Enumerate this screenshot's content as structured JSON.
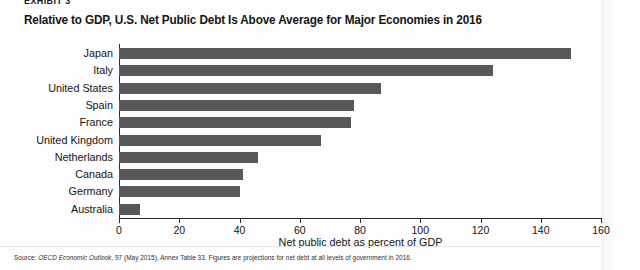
{
  "exhibit_tag": "EXHIBIT 3",
  "chart_title": "Relative to GDP, U.S. Net Public Debt Is Above Average for Major Economies in 2016",
  "source_note": {
    "prefix": "Source: ",
    "italic": "OECD Economic Outlook",
    "rest": ", 97 (May 2015), Annex Table 33. Figures are projections for net debt at all levels of government in 2016."
  },
  "colors": {
    "bar": "#58585a",
    "axis": "#2b2b2b",
    "text": "#151515",
    "background": "#fdfdfd"
  },
  "chart_data": {
    "type": "bar",
    "orientation": "horizontal",
    "title": "Relative to GDP, U.S. Net Public Debt Is Above Average for Major Economies in 2016",
    "xlabel": "Net public debt as percent of GDP",
    "ylabel": "",
    "xlim": [
      0,
      160
    ],
    "xticks": [
      0,
      20,
      40,
      60,
      80,
      100,
      120,
      140,
      160
    ],
    "grid": false,
    "legend": null,
    "categories": [
      "Japan",
      "Italy",
      "United States",
      "Spain",
      "France",
      "United Kingdom",
      "Netherlands",
      "Canada",
      "Germany",
      "Australia"
    ],
    "values": [
      150,
      124,
      87,
      78,
      77,
      67,
      46,
      41,
      40,
      7
    ],
    "series": [
      {
        "name": "Net public debt as percent of GDP, 2016 (projected)",
        "values": [
          150,
          124,
          87,
          78,
          77,
          67,
          46,
          41,
          40,
          7
        ]
      }
    ]
  }
}
